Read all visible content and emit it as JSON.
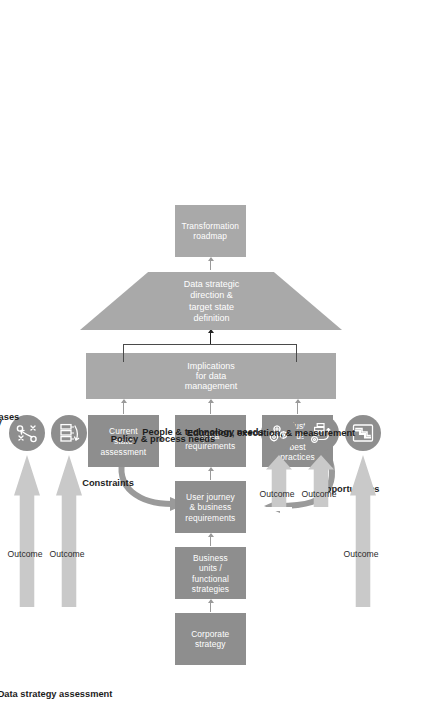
{
  "diagram": {
    "title": "Data strategy assessment",
    "type": "process-flow"
  },
  "headings": {
    "section": "Data strategy assessment"
  },
  "process_boxes": [
    {
      "id": "corporate-strategy",
      "label": "Corporate strategy"
    },
    {
      "id": "business-units",
      "label": "Business units / functional strategies"
    },
    {
      "id": "user-journey",
      "label": "User journey & business requirements"
    },
    {
      "id": "current-state",
      "label": "Current state assessment"
    },
    {
      "id": "data-requirements",
      "label": "Data requirements"
    },
    {
      "id": "industry-trends",
      "label": "Industry trends & best practices"
    },
    {
      "id": "transformation-roadmap",
      "label": "Transformation roadmap"
    }
  ],
  "implications": {
    "label": "Implications for data management"
  },
  "trapezoid": {
    "label": "Data strategic direction & target state definition"
  },
  "curved_labels": [
    {
      "id": "constraints",
      "label": "Constraints"
    },
    {
      "id": "opportunities",
      "label": "Opportunities"
    }
  ],
  "outcomes": [
    {
      "id": "data-vision",
      "title": "Data vision & strategy",
      "arrow_label": "Outcome",
      "icon": "strategy-playbook-icon"
    },
    {
      "id": "use-cases",
      "title": "Prioritized use cases",
      "arrow_label": "Outcome",
      "icon": "prioritized-bars-icon"
    },
    {
      "id": "policy",
      "title": "Policy & process needs",
      "arrow_label": "Outcome",
      "icon": "gears-icon"
    },
    {
      "id": "people-tech",
      "title": "People & technology needs",
      "arrow_label": "Outcome",
      "icon": "people-technology-icon"
    },
    {
      "id": "education",
      "title": "Education, execution, & measurement",
      "arrow_label": "Outcome",
      "icon": "roadmap-path-icon"
    }
  ],
  "colors": {
    "box_dark": "#8e8e8e",
    "box_light": "#a9a9a9",
    "arrow_gray": "#c9c9c9",
    "icon_bg": "#8e8e8e",
    "text_dark": "#1d1d1d",
    "background": "#ffffff"
  }
}
